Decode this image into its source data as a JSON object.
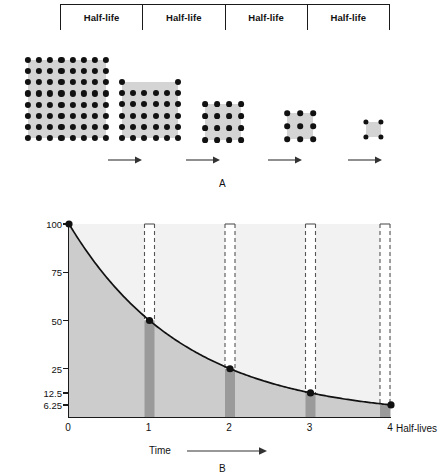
{
  "figure": {
    "panel_a_label": "A",
    "panel_b_label": "B"
  },
  "halflife_header": {
    "cells": [
      {
        "label": "Half-life"
      },
      {
        "label": "Half-life"
      },
      {
        "label": "Half-life"
      },
      {
        "label": "Half-life"
      }
    ]
  },
  "decay_grids": [
    {
      "name": "grid-0",
      "cols": 8,
      "rows": 8,
      "dots": 64,
      "x": 28,
      "y": 60,
      "w": 78,
      "h": 78,
      "dot_r": 3.1
    },
    {
      "name": "grid-1",
      "cols": 6,
      "rows": 6,
      "dots": 32,
      "x": 122,
      "y": 82,
      "w": 56,
      "h": 56,
      "dot_r": 3.0,
      "missing_top_interior": true
    },
    {
      "name": "grid-2",
      "cols": 4,
      "rows": 4,
      "dots": 16,
      "x": 205,
      "y": 104,
      "w": 36,
      "h": 36,
      "dot_r": 2.9
    },
    {
      "name": "grid-3",
      "cols": 3,
      "rows": 3,
      "dots": 9,
      "x": 287,
      "y": 113,
      "w": 26,
      "h": 26,
      "dot_r": 2.8
    },
    {
      "name": "grid-4",
      "cols": 2,
      "rows": 2,
      "dots": 4,
      "x": 366,
      "y": 122,
      "w": 15,
      "h": 15,
      "dot_r": 2.6
    }
  ],
  "decay_arrows": [
    {
      "name": "arrow-0",
      "x": 108,
      "y": 155,
      "w": 34
    },
    {
      "name": "arrow-1",
      "x": 186,
      "y": 155,
      "w": 34
    },
    {
      "name": "arrow-2",
      "x": 268,
      "y": 155,
      "w": 34
    },
    {
      "name": "arrow-3",
      "x": 348,
      "y": 155,
      "w": 34
    }
  ],
  "chart_data": {
    "type": "line",
    "title": "",
    "xlabel": "Time",
    "ylabel": "% of original radioactive isotopes",
    "x_unit_label": "Half-lives",
    "x": [
      0,
      1,
      2,
      3,
      4
    ],
    "values": [
      100,
      50,
      25,
      12.5,
      6.25
    ],
    "x_tick_labels": [
      "0",
      "1",
      "2",
      "3",
      "4"
    ],
    "y_tick_labels": [
      "100",
      "75",
      "50",
      "25",
      "12.5",
      "6.25"
    ],
    "y_tick_values": [
      100,
      75,
      50,
      25,
      12.5,
      6.25
    ],
    "xlim": [
      0,
      4
    ],
    "ylim": [
      0,
      100
    ],
    "grid": false,
    "legend": null,
    "area_fill": true,
    "markers": true,
    "dropline_bars": [
      {
        "x": 1,
        "value": 50,
        "dashed_top": 100
      },
      {
        "x": 2,
        "value": 25,
        "dashed_top": 100
      },
      {
        "x": 3,
        "value": 12.5,
        "dashed_top": 100
      },
      {
        "x": 4,
        "value": 6.25,
        "dashed_top": 100
      }
    ],
    "colors": {
      "plot_background": "#f2f2f2",
      "area_fill": "#cccccc",
      "curve": "#111111",
      "bar": "#9a9a9a",
      "axis": "#1a1a1a",
      "marker": "#111111"
    }
  }
}
